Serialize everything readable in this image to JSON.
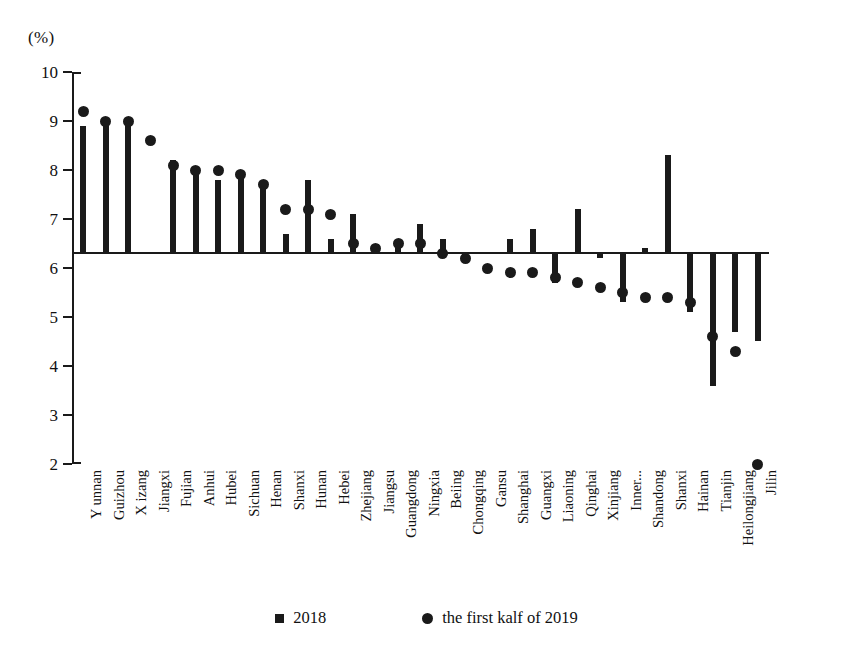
{
  "chart_data": {
    "type": "bar",
    "title": "",
    "unit_label": "(%)",
    "xlabel": "",
    "ylabel": "",
    "ylim": [
      2,
      10
    ],
    "yticks": [
      10,
      9,
      8,
      7,
      6,
      5,
      4,
      3,
      2
    ],
    "grid": false,
    "baseline_value": 6.3,
    "legend_position": "bottom",
    "categories": [
      "Y unnan",
      "Guizhou",
      "X izang",
      "Jiangxi",
      "Fujian",
      "Anhui",
      "Hubei",
      "Sichuan",
      "Henan",
      "Shanxi",
      "Hunan",
      "Hebei",
      "Zhejiang",
      "Jiangsu",
      "Guangdong",
      "Ningxia",
      "Beiing",
      "Chongqing",
      "Gansu",
      "Shanghai",
      "Guangxi",
      "Liaoning",
      "Qinghai",
      "Xinjiang",
      "Inner...",
      "Shandong",
      "Shanxi",
      "Hainan",
      "Tianjin",
      "Heilongjiang",
      "Jilin"
    ],
    "series": [
      {
        "name": "2018",
        "marker": "square",
        "color": "#1a1a1a",
        "values": [
          8.9,
          9.0,
          9.0,
          6.3,
          8.2,
          8.0,
          7.8,
          7.9,
          7.7,
          6.7,
          7.8,
          6.6,
          7.1,
          6.5,
          6.5,
          6.9,
          6.6,
          6.1,
          6.3,
          6.6,
          6.8,
          5.7,
          7.2,
          6.2,
          5.3,
          6.4,
          8.3,
          5.1,
          3.6,
          4.7,
          4.5
        ]
      },
      {
        "name": "the first kalf of 2019",
        "marker": "circle",
        "color": "#1a1a1a",
        "values": [
          9.2,
          9.0,
          9.0,
          8.6,
          8.1,
          8.0,
          8.0,
          7.9,
          7.7,
          7.2,
          7.2,
          7.1,
          6.5,
          6.4,
          6.5,
          6.5,
          6.3,
          6.2,
          6.0,
          5.9,
          5.9,
          5.8,
          5.7,
          5.6,
          5.5,
          5.4,
          5.4,
          5.3,
          4.6,
          4.3,
          2.0
        ]
      }
    ],
    "legend": [
      {
        "label": "2018",
        "marker": "square"
      },
      {
        "label": "the first kalf of 2019",
        "marker": "circle"
      }
    ]
  }
}
